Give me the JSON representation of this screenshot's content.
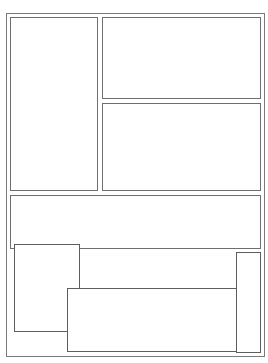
{
  "caption": {
    "text": "",
    "note": "clipped"
  },
  "colors": {
    "frame": "#7a7a7a",
    "panel": "#6e6e6e",
    "overlay": "#5e5e5e",
    "background": "#ffffff"
  },
  "layout": {
    "outer_frame": {
      "x": 6,
      "y": 13,
      "w": 259,
      "h": 344
    },
    "panels": [
      {
        "name": "left-tall-panel",
        "x": 10,
        "y": 17,
        "w": 88,
        "h": 174
      },
      {
        "name": "top-right-panel",
        "x": 102,
        "y": 17,
        "w": 159,
        "h": 82
      },
      {
        "name": "middle-right-panel",
        "x": 102,
        "y": 103,
        "w": 159,
        "h": 88
      },
      {
        "name": "wide-panel",
        "x": 10,
        "y": 195,
        "w": 251,
        "h": 54
      }
    ],
    "overlays": [
      {
        "name": "bottom-left-box",
        "x": 14,
        "y": 244,
        "w": 66,
        "h": 88
      },
      {
        "name": "bottom-center-box",
        "x": 67,
        "y": 288,
        "w": 170,
        "h": 64
      },
      {
        "name": "bottom-right-tall-box",
        "x": 236,
        "y": 252,
        "w": 25,
        "h": 101
      }
    ]
  }
}
